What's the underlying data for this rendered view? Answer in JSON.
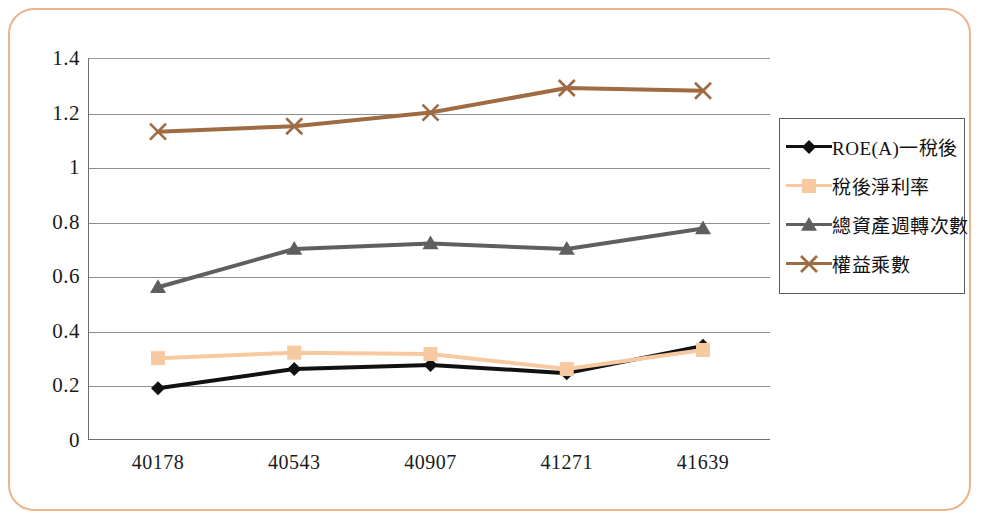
{
  "frame": {
    "border_color": "#e8b48c"
  },
  "chart_data": {
    "type": "line",
    "title": "",
    "subtitle": "",
    "xlabel": "",
    "ylabel": "",
    "categories": [
      "40178",
      "40543",
      "40907",
      "41271",
      "41639"
    ],
    "ylim": [
      0,
      1.4
    ],
    "yticks": [
      "0",
      "0.2",
      "0.4",
      "0.6",
      "0.8",
      "1",
      "1.2",
      "1.4"
    ],
    "ytick_values": [
      0,
      0.2,
      0.4,
      0.6,
      0.8,
      1,
      1.2,
      1.4
    ],
    "grid": true,
    "grid_axis": "y",
    "legend_position": "right",
    "series": [
      {
        "name": "ROE(A)一稅後",
        "values": [
          0.19,
          0.26,
          0.275,
          0.245,
          0.345
        ],
        "color": "#111111",
        "marker": "diamond"
      },
      {
        "name": "稅後淨利率",
        "values": [
          0.3,
          0.32,
          0.315,
          0.26,
          0.33
        ],
        "color": "#f7c9a0",
        "marker": "square"
      },
      {
        "name": "總資產週轉次數",
        "values": [
          0.56,
          0.7,
          0.72,
          0.7,
          0.775
        ],
        "color": "#5f5f5f",
        "marker": "triangle"
      },
      {
        "name": "權益乘數",
        "values": [
          1.13,
          1.15,
          1.2,
          1.29,
          1.28
        ],
        "color": "#9e6b43",
        "marker": "cross"
      }
    ]
  }
}
